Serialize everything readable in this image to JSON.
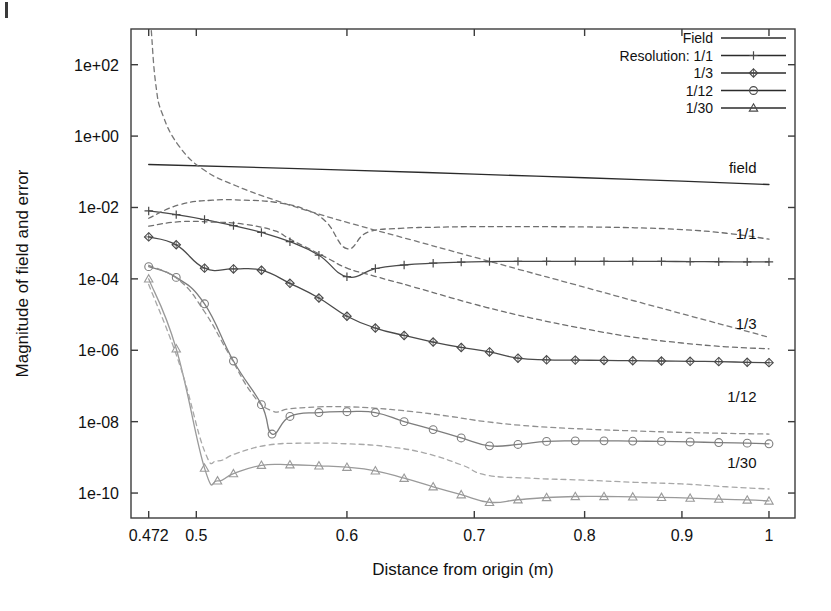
{
  "figure": {
    "page_mark": "page-edge-mark"
  },
  "chart_data": {
    "type": "line",
    "title": "",
    "xlabel": "Distance from origin (m)",
    "ylabel": "Magnitude of field and error",
    "xscale": "log",
    "yscale": "log",
    "xlim": [
      0.462,
      1.032
    ],
    "ylim": [
      2e-11,
      1000.0
    ],
    "grid": false,
    "xticks": [
      0.472,
      0.5,
      0.6,
      0.7,
      0.8,
      0.9,
      1
    ],
    "xtick_labels": [
      "0.472",
      "0.5",
      "0.6",
      "0.7",
      "0.8",
      "0.9",
      "1"
    ],
    "yticks": [
      100,
      1,
      0.01,
      0.0001,
      1e-06,
      1e-08,
      1e-10
    ],
    "ytick_labels": [
      "1e+02",
      "1e+00",
      "1e-02",
      "1e-04",
      "1e-06",
      "1e-08",
      "1e-10"
    ],
    "legend": {
      "position": "top-right",
      "entries": [
        {
          "label": "Field",
          "style": "solid",
          "marker": "none"
        },
        {
          "label": "Resolution: 1/1",
          "style": "solid",
          "marker": "plus"
        },
        {
          "label": "1/3",
          "style": "solid",
          "marker": "diamond"
        },
        {
          "label": "1/12",
          "style": "solid",
          "marker": "circle"
        },
        {
          "label": "1/30",
          "style": "solid",
          "marker": "triangle"
        }
      ]
    },
    "annotations": [
      {
        "text": "field",
        "x": 0.985,
        "y": 0.075
      },
      {
        "text": "1/1",
        "x": 0.985,
        "y": 0.0011
      },
      {
        "text": "1/3",
        "x": 0.985,
        "y": 3.3e-06
      },
      {
        "text": "1/12",
        "x": 0.985,
        "y": 3e-08
      },
      {
        "text": "1/30",
        "x": 0.985,
        "y": 4.2e-10
      }
    ],
    "series": [
      {
        "name": "Field",
        "style": "solid",
        "marker": "none",
        "color": "#2b2b2b",
        "x": [
          0.472,
          0.6,
          0.7,
          0.8,
          0.9,
          1.0
        ],
        "y": [
          0.16,
          0.112,
          0.086,
          0.068,
          0.055,
          0.044
        ]
      },
      {
        "name": "Resolution: 1/1 error",
        "style": "solid",
        "marker": "plus",
        "color": "#4a4a4a",
        "x": [
          0.472,
          0.488,
          0.505,
          0.523,
          0.541,
          0.56,
          0.58,
          0.6,
          0.621,
          0.643,
          0.666,
          0.689,
          0.713,
          0.738,
          0.764,
          0.791,
          0.819,
          0.848,
          0.878,
          0.909,
          0.941,
          0.974,
          1.0
        ],
        "y": [
          0.008,
          0.0063,
          0.0046,
          0.0031,
          0.002,
          0.0011,
          0.00046,
          0.000115,
          0.000195,
          0.000245,
          0.000275,
          0.000295,
          0.000305,
          0.00031,
          0.00031,
          0.00031,
          0.00031,
          0.00031,
          0.000308,
          0.000305,
          0.000302,
          0.0003,
          0.0003
        ]
      },
      {
        "name": "Resolution: 1/1 bound",
        "style": "dashed",
        "marker": "none",
        "color": "#6e6e6e",
        "x": [
          0.472,
          0.49,
          0.51,
          0.53,
          0.55,
          0.57,
          0.585,
          0.6,
          0.615,
          0.64,
          0.67,
          0.7,
          0.75,
          0.8,
          0.85,
          0.9,
          0.95,
          1.0
        ],
        "y": [
          0.005,
          0.012,
          0.016,
          0.016,
          0.014,
          0.009,
          0.004,
          0.0007,
          0.002,
          0.0026,
          0.0028,
          0.0029,
          0.0029,
          0.00285,
          0.0027,
          0.0024,
          0.0019,
          0.0013
        ]
      },
      {
        "name": "Resolution: 1/3 error",
        "style": "solid",
        "marker": "diamond",
        "color": "#4a4a4a",
        "x": [
          0.472,
          0.488,
          0.505,
          0.523,
          0.541,
          0.56,
          0.58,
          0.6,
          0.621,
          0.643,
          0.666,
          0.689,
          0.713,
          0.738,
          0.764,
          0.791,
          0.819,
          0.848,
          0.878,
          0.909,
          0.941,
          0.974,
          1.0
        ],
        "y": [
          0.0015,
          0.0009,
          0.0002,
          0.00019,
          0.000175,
          7.5e-05,
          2.9e-05,
          9e-06,
          4.2e-06,
          2.6e-06,
          1.7e-06,
          1.2e-06,
          9e-07,
          6e-07,
          5.4e-07,
          5.3e-07,
          5.2e-07,
          5.1e-07,
          5e-07,
          4.9e-07,
          4.8e-07,
          4.6e-07,
          4.5e-07
        ]
      },
      {
        "name": "Resolution: 1/3 bound",
        "style": "dashed",
        "marker": "none",
        "color": "#6e6e6e",
        "x": [
          0.472,
          0.49,
          0.51,
          0.53,
          0.55,
          0.56,
          0.585,
          0.6,
          0.62,
          0.65,
          0.68,
          0.71,
          0.75,
          0.8,
          0.85,
          0.9,
          0.95,
          1.0
        ],
        "y": [
          0.003,
          0.004,
          0.0039,
          0.0034,
          0.0022,
          0.0013,
          0.0004,
          0.0002,
          0.00012,
          6e-05,
          3e-05,
          1.6e-05,
          8e-06,
          4e-06,
          2.3e-06,
          1.6e-06,
          1.25e-06,
          1.1e-06
        ]
      },
      {
        "name": "Resolution: 1/12 error",
        "style": "solid",
        "marker": "circle",
        "color": "#7d7d7d",
        "x": [
          0.472,
          0.488,
          0.505,
          0.523,
          0.541,
          0.548,
          0.56,
          0.58,
          0.6,
          0.621,
          0.643,
          0.666,
          0.689,
          0.713,
          0.738,
          0.764,
          0.791,
          0.819,
          0.848,
          0.878,
          0.909,
          0.941,
          0.974,
          1.0
        ],
        "y": [
          0.00022,
          0.00011,
          2e-05,
          5e-07,
          3e-08,
          4.5e-09,
          1.4e-08,
          1.8e-08,
          1.9e-08,
          1.8e-08,
          1e-08,
          6e-09,
          3.5e-09,
          2.1e-09,
          2.3e-09,
          2.8e-09,
          2.9e-09,
          2.9e-09,
          2.85e-09,
          2.8e-09,
          2.7e-09,
          2.6e-09,
          2.5e-09,
          2.4e-09
        ]
      },
      {
        "name": "Resolution: 1/12 bound",
        "style": "dashed",
        "marker": "none",
        "color": "#8f8f8f",
        "x": [
          0.472,
          0.49,
          0.505,
          0.52,
          0.535,
          0.548,
          0.56,
          0.58,
          0.6,
          0.62,
          0.65,
          0.68,
          0.71,
          0.75,
          0.8,
          0.85,
          0.9,
          0.95,
          1.0
        ],
        "y": [
          0.00024,
          9e-05,
          1.2e-05,
          8e-07,
          6e-08,
          2e-08,
          2.3e-08,
          2.6e-08,
          2.6e-08,
          2.4e-08,
          1.9e-08,
          1.4e-08,
          1e-08,
          7.5e-09,
          6.2e-09,
          5.5e-09,
          5e-09,
          4.7e-09,
          4.5e-09
        ]
      },
      {
        "name": "Resolution: 1/30 error",
        "style": "solid",
        "marker": "triangle",
        "color": "#9a9a9a",
        "x": [
          0.472,
          0.488,
          0.505,
          0.513,
          0.523,
          0.541,
          0.56,
          0.58,
          0.6,
          0.621,
          0.643,
          0.666,
          0.689,
          0.713,
          0.738,
          0.764,
          0.791,
          0.819,
          0.848,
          0.878,
          0.909,
          0.941,
          0.974,
          1.0
        ],
        "y": [
          0.0001,
          1.1e-06,
          5e-10,
          2.2e-10,
          3.5e-10,
          6e-10,
          6.2e-10,
          5.8e-10,
          5.3e-10,
          4.2e-10,
          2.6e-10,
          1.5e-10,
          9e-11,
          5.5e-11,
          6.5e-11,
          7.5e-11,
          8e-11,
          8e-11,
          7.8e-11,
          7.6e-11,
          7.2e-11,
          6.8e-11,
          6.4e-11,
          6e-11
        ]
      },
      {
        "name": "Resolution: 1/30 bound",
        "style": "dashed",
        "marker": "none",
        "color": "#a8a8a8",
        "x": [
          0.472,
          0.49,
          0.505,
          0.513,
          0.525,
          0.545,
          0.57,
          0.6,
          0.63,
          0.66,
          0.69,
          0.71,
          0.75,
          0.8,
          0.85,
          0.9,
          0.95,
          1.0
        ],
        "y": [
          7e-05,
          4e-07,
          1.5e-09,
          8e-10,
          1.3e-09,
          2.2e-09,
          2.5e-09,
          2.4e-09,
          2e-09,
          1.3e-09,
          6e-10,
          3.2e-10,
          2.6e-10,
          2.3e-10,
          2e-10,
          1.8e-10,
          1.5e-10,
          1.3e-10
        ]
      },
      {
        "name": "Resolution: 1/1 upper divergence",
        "style": "dashed",
        "marker": "none",
        "color": "#777777",
        "x": [
          0.4735,
          0.476,
          0.48,
          0.49,
          0.505,
          0.525,
          0.55,
          0.58,
          0.61,
          0.65,
          0.69,
          0.74,
          0.79,
          0.85,
          0.91,
          0.97,
          1.0
        ],
        "y": [
          900,
          30,
          4.0,
          0.5,
          0.11,
          0.04,
          0.016,
          0.0065,
          0.003,
          0.0012,
          0.0005,
          0.00018,
          7e-05,
          2.4e-05,
          9e-06,
          3.6e-06,
          2.3e-06
        ]
      }
    ]
  }
}
